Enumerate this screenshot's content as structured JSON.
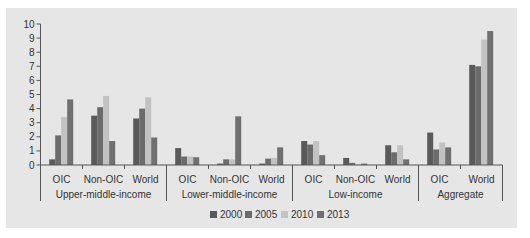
{
  "chart_data": {
    "type": "bar",
    "title": "",
    "xlabel": "",
    "ylabel": "",
    "ylim": [
      0,
      10
    ],
    "yticks": [
      0,
      1,
      2,
      3,
      4,
      5,
      6,
      7,
      8,
      9,
      10
    ],
    "grid": false,
    "legend_position": "bottom",
    "groups": [
      {
        "name": "Upper-middle-income",
        "categories": [
          "OIC",
          "Non-OIC",
          "World"
        ]
      },
      {
        "name": "Lower-middle-income",
        "categories": [
          "OIC",
          "Non-OIC",
          "World"
        ]
      },
      {
        "name": "Low-income",
        "categories": [
          "OIC",
          "Non-OIC",
          "World"
        ]
      },
      {
        "name": "Aggregate",
        "categories": [
          "OIC",
          "World"
        ]
      }
    ],
    "categories": [
      "Upper-middle-income / OIC",
      "Upper-middle-income / Non-OIC",
      "Upper-middle-income / World",
      "Lower-middle-income / OIC",
      "Lower-middle-income / Non-OIC",
      "Lower-middle-income / World",
      "Low-income / OIC",
      "Low-income / Non-OIC",
      "Low-income / World",
      "Aggregate / OIC",
      "Aggregate / World"
    ],
    "series": [
      {
        "name": "2000",
        "color": "#5a5a5a",
        "values": [
          0.4,
          3.5,
          3.3,
          1.2,
          0.1,
          0.1,
          1.7,
          0.5,
          1.4,
          2.3,
          7.1
        ]
      },
      {
        "name": "2005",
        "color": "#6b6b6b",
        "values": [
          2.1,
          4.1,
          4.0,
          0.6,
          0.4,
          0.45,
          1.45,
          0.15,
          0.9,
          1.1,
          7.0
        ]
      },
      {
        "name": "2010",
        "color": "#c2c2c2",
        "values": [
          3.4,
          4.9,
          4.8,
          0.6,
          0.4,
          0.5,
          1.7,
          0.05,
          1.4,
          1.6,
          8.9
        ]
      },
      {
        "name": "2013",
        "color": "#707070",
        "values": [
          4.65,
          1.7,
          1.95,
          0.55,
          3.45,
          1.25,
          0.7,
          0.1,
          0.4,
          1.25,
          9.5
        ]
      }
    ]
  }
}
